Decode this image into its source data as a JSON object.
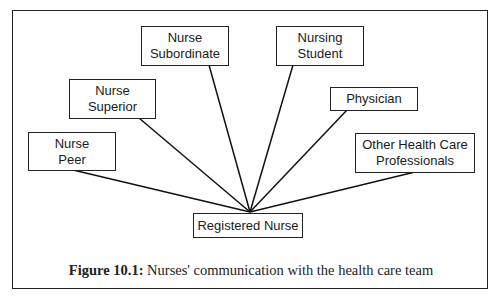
{
  "diagram": {
    "center": {
      "id": "registered-nurse",
      "label": "Registered Nurse"
    },
    "nodes": [
      {
        "id": "nurse-subordinate",
        "label": "Nurse\nSubordinate"
      },
      {
        "id": "nurse-superior",
        "label": "Nurse\nSuperior"
      },
      {
        "id": "nurse-peer",
        "label": "Nurse\nPeer"
      },
      {
        "id": "nursing-student",
        "label": "Nursing\nStudent"
      },
      {
        "id": "physician",
        "label": "Physician"
      },
      {
        "id": "other-health-care-professionals",
        "label": "Other Health Care\nProfessionals"
      }
    ],
    "edges": [
      {
        "from": "nurse-subordinate",
        "to": "registered-nurse"
      },
      {
        "from": "nurse-superior",
        "to": "registered-nurse"
      },
      {
        "from": "nurse-peer",
        "to": "registered-nurse"
      },
      {
        "from": "nursing-student",
        "to": "registered-nurse"
      },
      {
        "from": "physician",
        "to": "registered-nurse"
      },
      {
        "from": "other-health-care-professionals",
        "to": "registered-nurse"
      }
    ]
  },
  "caption": {
    "label": "Figure 10.1:",
    "text": " Nurses' communication with the health care team"
  }
}
